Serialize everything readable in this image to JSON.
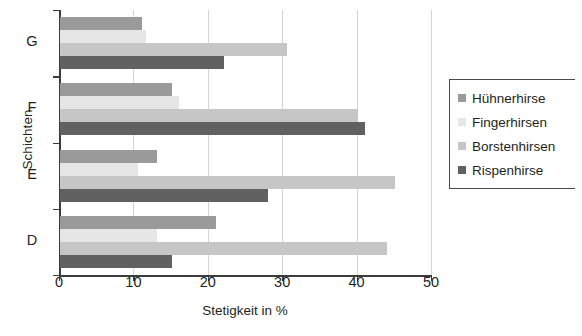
{
  "chart_data": {
    "type": "bar",
    "orientation": "horizontal",
    "title": "",
    "xlabel": "Stetigkeit in %",
    "ylabel": "Schichten",
    "categories": [
      "G",
      "F",
      "E",
      "D"
    ],
    "xlim": [
      0,
      50
    ],
    "xticks": [
      0,
      10,
      20,
      30,
      40,
      50
    ],
    "grid": true,
    "legend_position": "right",
    "series": [
      {
        "name": "Hühnerhirse",
        "color": "#9a9a9a",
        "values": [
          11,
          15,
          13,
          21
        ]
      },
      {
        "name": "Fingerhirsen",
        "color": "#e6e6e6",
        "values": [
          11.5,
          16,
          10.5,
          13
        ]
      },
      {
        "name": "Borstenhirsen",
        "color": "#c6c6c6",
        "values": [
          30.5,
          40,
          45,
          44
        ]
      },
      {
        "name": "Rispenhirse",
        "color": "#616161",
        "values": [
          22,
          41,
          28,
          15
        ]
      }
    ]
  },
  "axis": {
    "x_title": "Stetigkeit in %",
    "y_title": "Schichten",
    "x_tick_labels": [
      "0",
      "10",
      "20",
      "30",
      "40",
      "50"
    ],
    "y_tick_labels": [
      "G",
      "F",
      "E",
      "D"
    ]
  },
  "legend": {
    "items": [
      {
        "label": "Hühnerhirse",
        "color": "#9a9a9a"
      },
      {
        "label": "Fingerhirsen",
        "color": "#e6e6e6"
      },
      {
        "label": "Borstenhirsen",
        "color": "#c6c6c6"
      },
      {
        "label": "Rispenhirse",
        "color": "#616161"
      }
    ]
  }
}
